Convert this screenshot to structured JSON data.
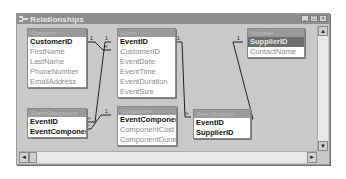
{
  "window": {
    "title": "Relationships",
    "controls": {
      "minimize": "_",
      "maximize": "□",
      "close": "×"
    }
  },
  "tables": [
    {
      "name": "Customer",
      "fields": [
        "CustomerID",
        "FirstName",
        "LastName",
        "PhoneNumber",
        "EmailAddress"
      ],
      "keys": [
        "CustomerID"
      ]
    },
    {
      "name": "Event",
      "fields": [
        "EventID",
        "CustomerID",
        "EventDate",
        "EventTime",
        "EventDuration",
        "EventSize"
      ],
      "keys": [
        "EventID"
      ]
    },
    {
      "name": "EventComponent",
      "fields": [
        "EventID",
        "EventComponent"
      ],
      "keys": [
        "EventID",
        "EventComponent"
      ]
    },
    {
      "name": "Component",
      "fields": [
        "EventComponent",
        "ComponentCost",
        "ComponentDuratio"
      ],
      "keys": [
        "EventComponent"
      ]
    },
    {
      "name": "EventSupplier",
      "fields": [
        "EventID",
        "SupplierID"
      ],
      "keys": [
        "EventID",
        "SupplierID"
      ]
    },
    {
      "name": "Supplier",
      "fields": [
        "SupplierID",
        "ContactName"
      ],
      "keys": [
        "SupplierID"
      ],
      "selected": "SupplierID"
    }
  ],
  "relationships": [
    {
      "from": "Customer.CustomerID",
      "to": "Event.CustomerID",
      "one": "1",
      "many": "∞"
    },
    {
      "from": "Event.EventID",
      "to": "EventComponent.EventID",
      "one": "1",
      "many": "∞"
    },
    {
      "from": "Component.EventComponent",
      "to": "EventComponent.EventComponent",
      "one": "1",
      "many": "∞"
    },
    {
      "from": "Event.EventID",
      "to": "EventSupplier.EventID",
      "one": "1",
      "many": "∞"
    },
    {
      "from": "Supplier.SupplierID",
      "to": "EventSupplier.SupplierID",
      "one": "1",
      "many": "∞"
    }
  ],
  "scrollbars": {
    "up": "▲",
    "down": "▼",
    "left": "◄",
    "right": "►"
  }
}
